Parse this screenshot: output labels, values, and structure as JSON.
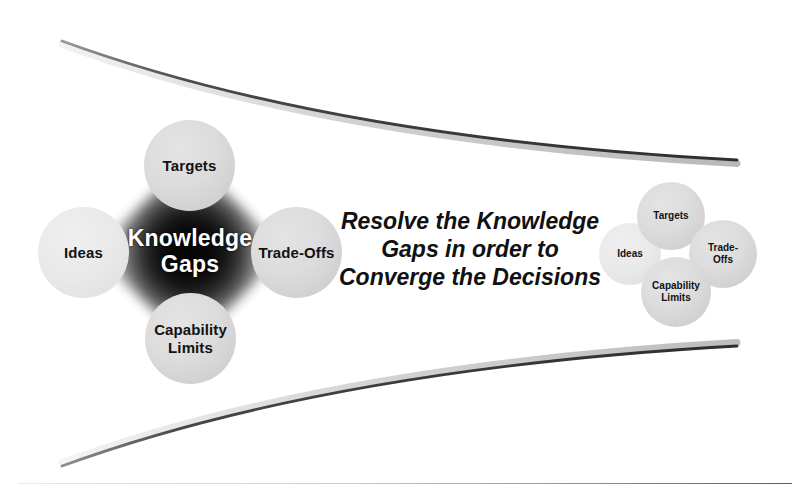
{
  "diagram": {
    "title": "Resolve the Knowledge Gaps in order to Converge the Decisions",
    "background_color": "#ffffff",
    "bubble_color": "#d8d8d8",
    "core_color": "#050505",
    "text_color": "#121212",
    "core_text_color": "#ffffff"
  },
  "statement": {
    "text": "Resolve the Knowledge\nGaps in order to\nConverge the Decisions",
    "line1": "Resolve the Knowledge",
    "line2": "Gaps in order to",
    "line3": "Converge the Decisions"
  },
  "left_cluster": {
    "name": "diverged-knowledge-gaps-cluster",
    "core": {
      "label": "Knowledge\nGaps",
      "line1": "Knowledge",
      "line2": "Gaps"
    },
    "bubbles": [
      {
        "id": "targets",
        "label": "Targets",
        "position": "top"
      },
      {
        "id": "ideas",
        "label": "Ideas",
        "position": "left"
      },
      {
        "id": "trade-offs",
        "label": "Trade-Offs",
        "position": "right"
      },
      {
        "id": "capability-limits",
        "label": "Capability\nLimits",
        "position": "bottom"
      }
    ]
  },
  "right_cluster": {
    "name": "converged-decisions-cluster",
    "bubbles": [
      {
        "id": "targets",
        "label": "Targets",
        "position": "top"
      },
      {
        "id": "ideas",
        "label": "Ideas",
        "position": "left"
      },
      {
        "id": "trade-offs",
        "label": "Trade-\nOffs",
        "position": "right"
      },
      {
        "id": "capability-limits",
        "label": "Capability\nLimits",
        "position": "bottom"
      }
    ]
  },
  "curves": {
    "top_label": "upper-converging-swoosh",
    "bottom_label": "lower-converging-swoosh",
    "color": "#3b3b3b"
  }
}
